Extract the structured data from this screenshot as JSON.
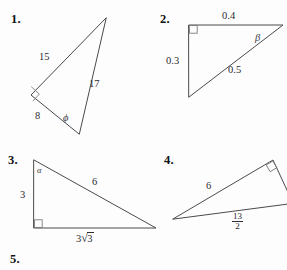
{
  "page": {
    "background_color": "#fdfdfd",
    "ink_color": "#2b2b2e",
    "cut_off_header_text": "",
    "trailing_item_number": "5."
  },
  "problems": [
    {
      "number": "1.",
      "shape": "right-triangle",
      "labels": {
        "side_upper_left": "15",
        "side_right": "17",
        "side_lower_left": "8",
        "angle": "ϕ",
        "right_angle_marker": true
      }
    },
    {
      "number": "2.",
      "shape": "right-triangle",
      "labels": {
        "side_top": "0.4",
        "side_left": "0.3",
        "side_hypotenuse": "0.5",
        "angle": "β",
        "right_angle_marker": true
      }
    },
    {
      "number": "3.",
      "shape": "right-triangle",
      "labels": {
        "side_left": "3",
        "side_hypotenuse": "6",
        "side_bottom_coefficient": "3",
        "side_bottom_radicand": "3",
        "side_bottom": "3√3",
        "angle": "α",
        "right_angle_marker": true
      }
    },
    {
      "number": "4.",
      "shape": "right-triangle",
      "labels": {
        "side_upper": "6",
        "side_bottom_numerator": "13",
        "side_bottom_denominator": "2",
        "side_bottom": "13/2",
        "right_angle_marker": true
      }
    }
  ]
}
